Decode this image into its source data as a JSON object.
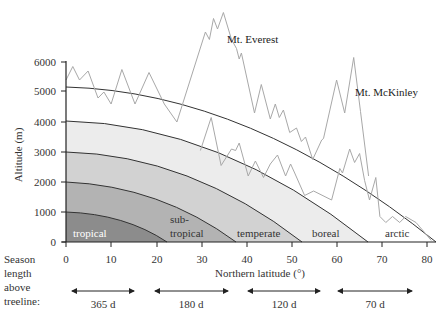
{
  "chart_data": {
    "type": "line",
    "title": "",
    "xlabel": "Northern latitude (°)",
    "ylabel": "Altitude (m)",
    "xlim": [
      0,
      82
    ],
    "ylim": [
      0,
      6000
    ],
    "x_ticks": [
      0,
      10,
      20,
      30,
      40,
      50,
      60,
      70,
      80
    ],
    "y_ticks": [
      0,
      1000,
      2000,
      3000,
      4000,
      5000,
      6000
    ],
    "grid": false,
    "zone_boundaries": [
      {
        "name": "tropical upper boundary",
        "altitude_at_equator": 1000,
        "latitude_at_sea_level": 22
      },
      {
        "name": "subtropical upper boundary",
        "altitude_at_equator": 2000,
        "latitude_at_sea_level": 38
      },
      {
        "name": "temperate upper boundary",
        "altitude_at_equator": 3000,
        "latitude_at_sea_level": 52
      },
      {
        "name": "boreal upper boundary",
        "altitude_at_equator": 4000,
        "latitude_at_sea_level": 67
      },
      {
        "name": "treeline",
        "altitude_at_equator": 5200,
        "latitude_at_sea_level": 82
      }
    ],
    "zones": [
      {
        "label": "tropical",
        "color": "#8c8c8c",
        "text_color": "#ffffff"
      },
      {
        "label": "sub-\ntropical",
        "color": "#b3b3b3",
        "text_color": "#333333"
      },
      {
        "label": "temperate",
        "color": "#d2d2d2",
        "text_color": "#333333"
      },
      {
        "label": "boreal",
        "color": "#ececec",
        "text_color": "#333333"
      },
      {
        "label": "arctic",
        "color": "#ffffff",
        "text_color": "#333333"
      }
    ],
    "series": [
      {
        "name": "Mountain profile A (Mt. Everest)",
        "annotation": "Mt. Everest",
        "points_lat_alt": [
          [
            0,
            5400
          ],
          [
            1.5,
            5850
          ],
          [
            3,
            5400
          ],
          [
            4.9,
            5700
          ],
          [
            7.1,
            4800
          ],
          [
            8.4,
            5000
          ],
          [
            10,
            4600
          ],
          [
            12.4,
            5750
          ],
          [
            15.3,
            4600
          ],
          [
            18.4,
            5650
          ],
          [
            21.8,
            4600
          ],
          [
            24.6,
            4000
          ],
          [
            30.9,
            7000
          ],
          [
            31.8,
            6750
          ],
          [
            32.7,
            7450
          ],
          [
            33.6,
            7100
          ],
          [
            34.9,
            7650
          ],
          [
            36.7,
            6750
          ],
          [
            37.8,
            6450
          ],
          [
            38.4,
            6100
          ],
          [
            38.9,
            6300
          ],
          [
            41.8,
            4300
          ],
          [
            43.3,
            5250
          ],
          [
            45.3,
            4100
          ],
          [
            46.4,
            4600
          ],
          [
            47.3,
            4150
          ],
          [
            48.2,
            4400
          ],
          [
            49.6,
            3650
          ],
          [
            51.1,
            3800
          ],
          [
            52.2,
            3350
          ],
          [
            53.1,
            3500
          ],
          [
            54.7,
            2750
          ],
          [
            56.7,
            3400
          ],
          [
            57.1,
            3450
          ],
          [
            60,
            5400
          ],
          [
            61.8,
            4300
          ],
          [
            63.8,
            6150
          ],
          [
            65.3,
            4350
          ],
          [
            67.1,
            2200
          ]
        ]
      },
      {
        "name": "Mountain profile B (Mt. McKinley)",
        "annotation": "Mt. McKinley",
        "points_lat_alt": [
          [
            29.8,
            3050
          ],
          [
            32.2,
            4150
          ],
          [
            34.4,
            2550
          ],
          [
            36.7,
            3100
          ],
          [
            37.6,
            3050
          ],
          [
            38.4,
            3300
          ],
          [
            40.4,
            2200
          ],
          [
            42,
            2700
          ],
          [
            43.8,
            2150
          ],
          [
            45.3,
            2600
          ],
          [
            46.9,
            2900
          ],
          [
            48.7,
            2200
          ],
          [
            49.8,
            2600
          ],
          [
            50.7,
            2300
          ],
          [
            52.9,
            1550
          ],
          [
            54.9,
            1700
          ],
          [
            58.9,
            1400
          ],
          [
            60.7,
            2450
          ],
          [
            61.3,
            2300
          ],
          [
            62.9,
            3100
          ],
          [
            64,
            2650
          ],
          [
            65.1,
            2950
          ],
          [
            66.2,
            2050
          ],
          [
            67.3,
            1400
          ],
          [
            68.7,
            2150
          ],
          [
            69.6,
            850
          ],
          [
            70.9,
            650
          ],
          [
            72.4,
            850
          ],
          [
            74,
            650
          ],
          [
            75.3,
            850
          ],
          [
            77.6,
            650
          ],
          [
            79.6,
            300
          ],
          [
            81,
            50
          ]
        ]
      }
    ],
    "season_length_above_treeline": {
      "label": "Season length above treeline:",
      "spans": [
        {
          "from_lat": 1.3,
          "to_lat": 14.9,
          "value": "365 d"
        },
        {
          "from_lat": 19.8,
          "to_lat": 36,
          "value": "180 d"
        },
        {
          "from_lat": 40.4,
          "to_lat": 56.4,
          "value": "120 d"
        },
        {
          "from_lat": 60.4,
          "to_lat": 76.9,
          "value": "70 d"
        }
      ]
    }
  },
  "labels": {
    "ylabel": "Altitude (m)",
    "xlabel": "Northern latitude (°)",
    "season_line1": "Season",
    "season_line2": "length",
    "season_line3": "above",
    "season_line4": "treeline:",
    "everest": "Mt. Everest",
    "mckinley": "Mt. McKinley",
    "zone_tropical": "tropical",
    "zone_sub1": "sub-",
    "zone_sub2": "tropical",
    "zone_temperate": "temperate",
    "zone_boreal": "boreal",
    "zone_arctic": "arctic",
    "season_365": "365 d",
    "season_180": "180 d",
    "season_120": "120 d",
    "season_70": "70 d",
    "ytick_0": "0",
    "ytick_1000": "1000",
    "ytick_2000": "2000",
    "ytick_3000": "3000",
    "ytick_4000": "4000",
    "ytick_5000": "5000",
    "ytick_6000": "6000",
    "xtick_0": "0",
    "xtick_10": "10",
    "xtick_20": "20",
    "xtick_30": "30",
    "xtick_40": "40",
    "xtick_50": "50",
    "xtick_60": "60",
    "xtick_70": "70",
    "xtick_80": "80"
  }
}
